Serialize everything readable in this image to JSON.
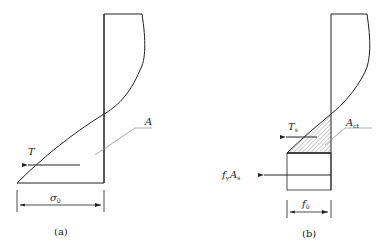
{
  "figure_a": {
    "caption": "(a)",
    "force_label": "T",
    "area_label": "A",
    "width_label": "σ",
    "width_sub": "0"
  },
  "figure_b": {
    "caption": "(b)",
    "force_label": "T",
    "force_sub": "s",
    "area_label": "A",
    "area_sub": "ct",
    "steel_force_f": "f",
    "steel_force_f_sub": "y",
    "steel_force_a": "A",
    "steel_force_a_sub": "s",
    "width_label": "f",
    "width_sub": "0"
  },
  "colors": {
    "line": "#222222",
    "leader": "#999999",
    "hatch": "#555555"
  }
}
